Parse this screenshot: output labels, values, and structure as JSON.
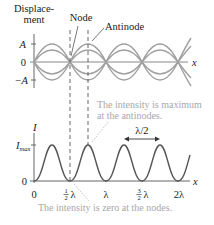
{
  "top_plot": {
    "ylabel_line1": "Displace-",
    "ylabel_line2": "ment",
    "y_ticks": [
      "A",
      "0",
      "−A"
    ],
    "x_axis_label": "x",
    "callouts": {
      "node": "Node",
      "antinode": "Antinode"
    },
    "wave_color": "#9a9a9a"
  },
  "bottom_plot": {
    "ylabel": "I",
    "y_ticks": [
      "I",
      "max",
      "0"
    ],
    "x_axis_label": "x",
    "x_ticks": [
      "0",
      "½λ",
      "λ",
      "³⁄₂λ",
      "2λ"
    ],
    "x_ticks_parts": {
      "half_num": "1",
      "half_den": "2",
      "lambda": "λ",
      "three_num": "3",
      "three_den": "2",
      "two_lambda": "2λ",
      "zero": "0"
    },
    "spacing_label": "λ/2",
    "curve_color": "#555555"
  },
  "annotations": {
    "max_line1": "The intensity is maximum",
    "max_line2": "at the antinodes.",
    "zero": "The intensity is zero at the nodes."
  },
  "colors": {
    "axis": "#555555",
    "note": "#a8a8a8",
    "text": "#222222"
  }
}
